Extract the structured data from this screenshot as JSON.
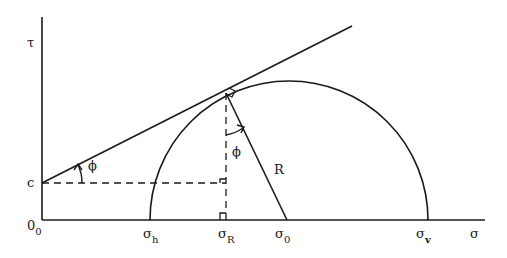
{
  "diagram": {
    "axes": {
      "y_label": "τ",
      "x_label": "σ",
      "origin_label": "0",
      "origin_sub": "0"
    },
    "labels": {
      "cohesion": "c",
      "friction_angle_envelope": "ϕ",
      "friction_angle_radius": "ϕ",
      "radius": "R",
      "sigma_h": {
        "main": "σ",
        "sub": "h"
      },
      "sigma_R": {
        "main": "σ",
        "sub": "R"
      },
      "sigma_0": {
        "main": "σ",
        "sub": "0"
      },
      "sigma_v": {
        "main": "σ",
        "sub": "v"
      }
    },
    "colors": {
      "line": "#1a1a1a",
      "background": "#ffffff"
    }
  }
}
